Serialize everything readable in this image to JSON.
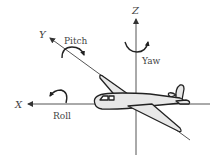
{
  "diagram": {
    "axes": {
      "x": {
        "label": "X",
        "rotation": "Roll"
      },
      "y": {
        "label": "Y",
        "rotation": "Pitch"
      },
      "z": {
        "label": "Z",
        "rotation": "Yaw"
      }
    },
    "colors": {
      "line": "#555555",
      "outline": "#222222",
      "plane_fill": "#e8e8e8",
      "text": "#444444",
      "background": "#ffffff"
    }
  }
}
